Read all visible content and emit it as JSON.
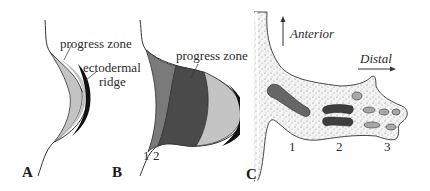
{
  "figure": {
    "panels": [
      {
        "letter": "A",
        "labels": {
          "progress_zone": "progress zone",
          "ectodermal_1": "ectodermal",
          "ectodermal_2": "ridge"
        }
      },
      {
        "letter": "B",
        "labels": {
          "progress_zone": "progress zone",
          "segment_1": "1",
          "segment_2": "2"
        }
      },
      {
        "letter": "C",
        "labels": {
          "anterior": "Anterior",
          "distal": "Distal",
          "region_1": "1",
          "region_2": "2",
          "region_3": "3"
        }
      }
    ],
    "colors": {
      "progress_zone": "#b8b8b8",
      "ridge": "#111111",
      "segment_1": "#7a7a7a",
      "segment_2": "#4a4a4a",
      "limb_fill": "#eeeeee",
      "bone_1": "#6a6a6a",
      "bone_2": "#3e3e3e",
      "bone_3": "#a8a8a8"
    }
  }
}
